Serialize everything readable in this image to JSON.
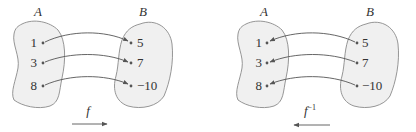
{
  "colors": {
    "set_fill": "#f0f0f0",
    "set_stroke": "#8a8a8a",
    "ink": "#333333",
    "arrow": "#555555"
  },
  "diagrams": [
    {
      "name": "function-f",
      "domain_label": "A",
      "codomain_label": "B",
      "domain_elements": [
        "1",
        "3",
        "8"
      ],
      "codomain_elements": [
        "5",
        "7",
        "−10"
      ],
      "mappings": [
        [
          "1",
          "5"
        ],
        [
          "3",
          "7"
        ],
        [
          "8",
          "−10"
        ]
      ],
      "mapping_direction": "A-to-B",
      "function_label": "f",
      "function_superscript": ""
    },
    {
      "name": "inverse-function",
      "domain_label": "A",
      "codomain_label": "B",
      "domain_elements": [
        "1",
        "3",
        "8"
      ],
      "codomain_elements": [
        "5",
        "7",
        "−10"
      ],
      "mappings": [
        [
          "5",
          "1"
        ],
        [
          "7",
          "3"
        ],
        [
          "−10",
          "8"
        ]
      ],
      "mapping_direction": "B-to-A",
      "function_label": "f",
      "function_superscript": "−1"
    }
  ]
}
